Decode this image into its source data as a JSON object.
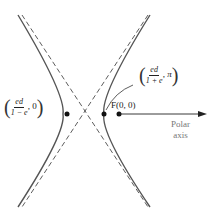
{
  "figure": {
    "type": "hyperbola polar diagram",
    "left_vertex_label": {
      "numerator": "ed",
      "denominator": "1 − e",
      "second_coord": "0"
    },
    "right_vertex_label": {
      "numerator": "ed",
      "denominator": "1 + e",
      "second_coord": "π"
    },
    "focus_label": "F(0, 0)",
    "axis_label_line1": "Polar",
    "axis_label_line2": "axis",
    "colors": {
      "curve": "#555555",
      "asymptote": "#333333",
      "points": "#111111",
      "axis_text": "#777777"
    }
  }
}
